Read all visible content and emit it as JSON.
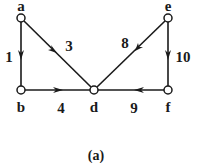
{
  "diagram": {
    "type": "directed-weighted-graph",
    "colors": {
      "stroke": "#1a1a1a",
      "node_fill": "#ffffff",
      "background": "#ffffff"
    },
    "nodes": [
      {
        "id": "a",
        "label": "a",
        "x": 21,
        "y": 18
      },
      {
        "id": "b",
        "label": "b",
        "x": 21,
        "y": 90
      },
      {
        "id": "d",
        "label": "d",
        "x": 94,
        "y": 90
      },
      {
        "id": "e",
        "label": "e",
        "x": 168,
        "y": 18
      },
      {
        "id": "f",
        "label": "f",
        "x": 168,
        "y": 90
      }
    ],
    "edges": [
      {
        "from": "a",
        "to": "b",
        "weight": "1"
      },
      {
        "from": "a",
        "to": "d",
        "weight": "3"
      },
      {
        "from": "b",
        "to": "d",
        "weight": "4"
      },
      {
        "from": "e",
        "to": "d",
        "weight": "8"
      },
      {
        "from": "f",
        "to": "d",
        "weight": "9"
      },
      {
        "from": "e",
        "to": "f",
        "weight": "10"
      }
    ],
    "caption": "(a)"
  }
}
